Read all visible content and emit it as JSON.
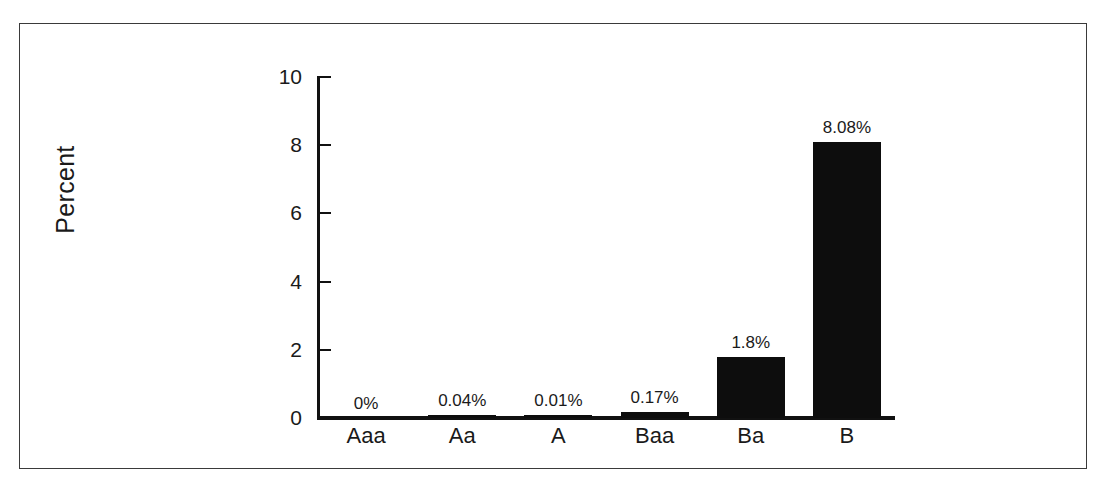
{
  "chart_data": {
    "type": "bar",
    "title": "",
    "subtitle": "",
    "xlabel": "",
    "ylabel": "Percent",
    "ylim": [
      0,
      10
    ],
    "yticks": [
      "0",
      "2",
      "4",
      "6",
      "8",
      "10"
    ],
    "ytick_values": [
      0,
      2,
      4,
      6,
      8,
      10
    ],
    "grid": false,
    "legend": "none",
    "categories": [
      "Aaa",
      "Aa",
      "A",
      "Baa",
      "Ba",
      "B"
    ],
    "values": [
      0,
      0.04,
      0.01,
      0.17,
      1.8,
      8.08
    ],
    "data_labels": [
      "0%",
      "0.04%",
      "0.01%",
      "0.17%",
      "1.8%",
      "8.08%"
    ],
    "bar_color": "#0d0d0d",
    "axis_color": "#111111",
    "background_color": "#ffffff",
    "frame_color": "#3a3a3a"
  }
}
